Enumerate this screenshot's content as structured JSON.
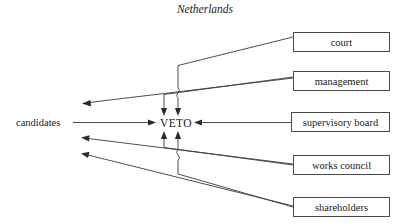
{
  "figure": {
    "title": "Netherlands",
    "type": "organizational-flow-diagram",
    "center_node": "VETO",
    "left_node": "candidates",
    "right_nodes": [
      {
        "label": "court"
      },
      {
        "label": "management"
      },
      {
        "label": "supervisory board"
      },
      {
        "label": "works council"
      },
      {
        "label": "shareholders"
      }
    ],
    "colors": {
      "background": "#ffffff",
      "box_stroke": "#4a4a4a",
      "line_stroke": "#3a3a3a",
      "text": "#1a1a1a"
    },
    "edges": [
      {
        "from": "court",
        "to": "VETO",
        "kind": "veto-into-center"
      },
      {
        "from": "management",
        "to": "VETO",
        "kind": "veto-into-center"
      },
      {
        "from": "supervisory board",
        "to": "VETO",
        "kind": "direct-horizontal"
      },
      {
        "from": "works council",
        "to": "VETO",
        "kind": "veto-into-center"
      },
      {
        "from": "shareholders",
        "to": "VETO",
        "kind": "veto-into-center"
      },
      {
        "from": "candidates",
        "to": "VETO",
        "kind": "direct-horizontal"
      },
      {
        "from": "court",
        "to": "candidates",
        "kind": "nomination-arrow"
      },
      {
        "from": "works council",
        "to": "candidates",
        "kind": "nomination-arrow"
      },
      {
        "from": "shareholders",
        "to": "candidates",
        "kind": "nomination-arrow"
      }
    ]
  }
}
